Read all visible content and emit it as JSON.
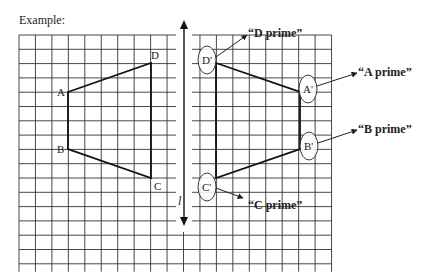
{
  "caption": "Example:",
  "axis": {
    "label": "l"
  },
  "grid": {
    "left": 19,
    "top": 35,
    "cols": 19,
    "rows": 16,
    "col_w": 16.45,
    "row_h": 14.3,
    "color": "#333333"
  },
  "original": {
    "points": [
      {
        "name": "A",
        "x": 68,
        "y": 92,
        "lx": 57,
        "ly": 96
      },
      {
        "name": "B",
        "x": 68,
        "y": 149,
        "lx": 57,
        "ly": 153
      },
      {
        "name": "C",
        "x": 151,
        "y": 178,
        "lx": 154,
        "ly": 190
      },
      {
        "name": "D",
        "x": 151,
        "y": 63,
        "lx": 151,
        "ly": 59
      }
    ]
  },
  "image": {
    "points": [
      {
        "name": "D'",
        "x": 216,
        "y": 63,
        "cx": 207,
        "cy": 60,
        "callout": "“D prime”",
        "tx": 248,
        "ty": 33,
        "ax": 247,
        "ay": 35
      },
      {
        "name": "A'",
        "x": 300,
        "y": 92,
        "cx": 308,
        "cy": 89,
        "callout": "“A prime”",
        "tx": 358,
        "ty": 72,
        "ax": 357,
        "ay": 73
      },
      {
        "name": "B'",
        "x": 300,
        "y": 149,
        "cx": 309,
        "cy": 146,
        "callout": "“B prime”",
        "tx": 358,
        "ty": 129,
        "ax": 357,
        "ay": 130
      },
      {
        "name": "C'",
        "x": 216,
        "y": 178,
        "cx": 207,
        "cy": 187,
        "callout": "“C prime”",
        "tx": 248,
        "ty": 205,
        "ax": 243,
        "ay": 198
      }
    ]
  },
  "colors": {
    "ink": "#222222",
    "grid": "#333333",
    "background": "#ffffff"
  }
}
